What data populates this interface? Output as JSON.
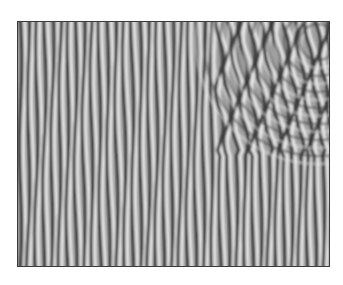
{
  "image": {
    "description": "grayscale stripe (labyrinthine roll) pattern inside a thin dark frame",
    "colors": {
      "background": "#ffffff",
      "frame": "#3a3a3a",
      "stripe_dark": "#3c3c3c",
      "stripe_light": "#e6e6e6",
      "mid_gray": "#9a9a9a"
    },
    "stripe_period_px": 8
  }
}
